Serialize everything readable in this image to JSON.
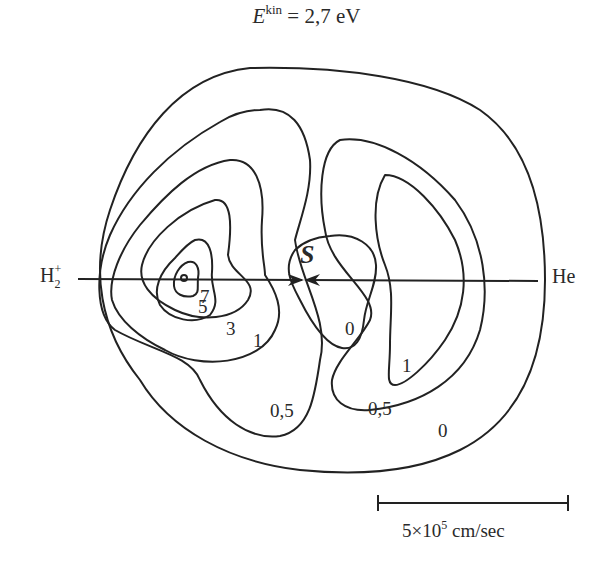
{
  "title": {
    "symbol": "E",
    "superscript": "kin",
    "equals_value": "= 2,7 eV"
  },
  "axis": {
    "left_label": "H",
    "left_label_subscript": "2",
    "left_label_superscript": "+",
    "right_label": "He"
  },
  "saddle_label": "S",
  "contour_levels": {
    "outer_0": "0",
    "level_05_left": "0,5",
    "level_05_right": "0,5",
    "level_1_left": "1",
    "level_1_right": "1",
    "level_3": "3",
    "level_5": "5",
    "level_7": "7",
    "inner_0": "0"
  },
  "scale_bar": {
    "mantissa": "5×10",
    "exponent": "5",
    "unit": " cm/sec"
  },
  "colors": {
    "line": "#222222",
    "background": "#ffffff"
  }
}
